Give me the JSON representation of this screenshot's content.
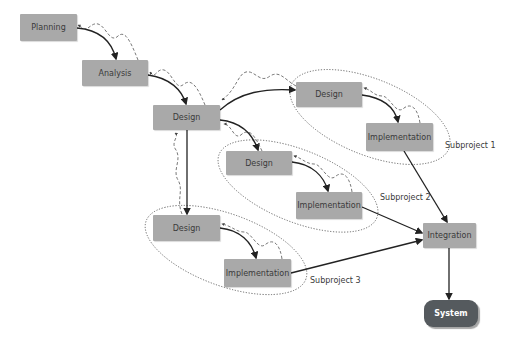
{
  "nodes": {
    "planning": "Planning",
    "analysis": "Analysis",
    "design_main": "Design",
    "design_sp1": "Design",
    "impl_sp1": "Implementation",
    "design_sp2": "Design",
    "impl_sp2": "Implementation",
    "design_sp3": "Design",
    "impl_sp3": "Implementation",
    "integration": "Integration",
    "system": "System"
  },
  "subprojects": {
    "sp1": "Subproject 1",
    "sp2": "Subproject 2",
    "sp3": "Subproject 3"
  },
  "colors": {
    "node_fill": "#a9a9a9",
    "system_fill": "#555a5e",
    "line": "#2a2a2a",
    "dashed": "#555555"
  }
}
